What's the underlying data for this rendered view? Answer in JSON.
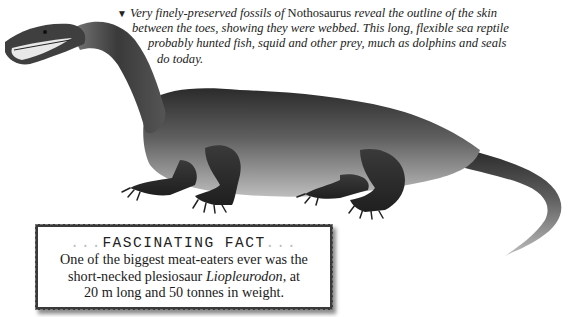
{
  "caption": {
    "marker": "▼",
    "line1_pre": "Very finely-preserved fossils of ",
    "genus": "Nothosaurus",
    "line1_post": " reveal the outline of the skin",
    "line2": "between the toes, showing they were webbed. This long, flexible sea reptile",
    "line3": "probably hunted fish, squid and other prey, much as dolphins and seals",
    "line4": "do today."
  },
  "fact_box": {
    "dots_left": "...",
    "title": "FASCINATING FACT",
    "dots_right": "...",
    "line1": "One of the biggest meat-eaters ever was the",
    "line2_pre": "short-necked plesiosaur ",
    "line2_em": "Liopleurodon",
    "line2_post": ", at",
    "line3": "20 m long and 50 tonnes in weight."
  },
  "illustration": {
    "subject": "Nothosaurus",
    "colors": {
      "dark": "#2e2e2e",
      "mid": "#6b6b6b",
      "light": "#a8a8a8",
      "belly": "#c4c4c4"
    }
  }
}
